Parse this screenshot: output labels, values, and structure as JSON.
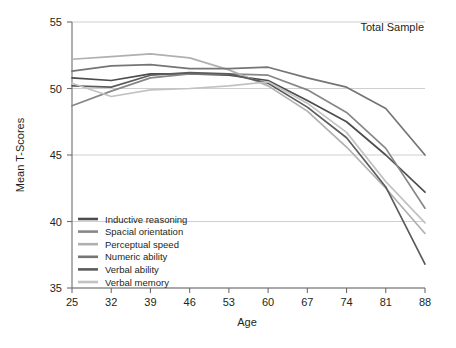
{
  "chart_data": {
    "type": "line",
    "title": "",
    "annotation": "Total Sample",
    "xlabel": "Age",
    "ylabel": "Mean T-Scores",
    "x": [
      25,
      32,
      39,
      46,
      53,
      60,
      67,
      74,
      81,
      88
    ],
    "xlim": [
      25,
      88
    ],
    "ylim": [
      35,
      55
    ],
    "yticks": [
      35,
      40,
      45,
      50,
      55
    ],
    "xticks": [
      25,
      32,
      39,
      46,
      53,
      60,
      67,
      74,
      81,
      88
    ],
    "grid": "horizontal",
    "legend_position": "lower-left-inside",
    "series": [
      {
        "name": "Inductive reasoning",
        "color": "#4d4d4d",
        "values": [
          50.8,
          50.6,
          51.1,
          51.1,
          51.0,
          50.6,
          49.1,
          47.5,
          45.0,
          42.2
        ]
      },
      {
        "name": "Spacial orientation",
        "color": "#878787",
        "values": [
          48.7,
          49.8,
          50.8,
          51.1,
          51.1,
          51.0,
          49.9,
          48.2,
          45.5,
          41.0
        ]
      },
      {
        "name": "Perceptual speed",
        "color": "#b0b0b0",
        "values": [
          52.2,
          52.4,
          52.6,
          52.3,
          51.4,
          50.2,
          48.3,
          45.6,
          42.5,
          39.1
        ]
      },
      {
        "name": "Numeric ability",
        "color": "#757575",
        "values": [
          51.3,
          51.7,
          51.8,
          51.5,
          51.5,
          51.6,
          50.8,
          50.1,
          48.5,
          45.0
        ]
      },
      {
        "name": "Verbal ability",
        "color": "#5c5c5c",
        "values": [
          50.2,
          50.1,
          51.0,
          51.2,
          51.1,
          50.4,
          48.6,
          46.3,
          42.6,
          36.8
        ]
      },
      {
        "name": "Verbal memory",
        "color": "#c2c2c2",
        "values": [
          50.4,
          49.4,
          49.9,
          50.0,
          50.2,
          50.5,
          48.9,
          46.7,
          43.0,
          39.9
        ]
      }
    ]
  }
}
